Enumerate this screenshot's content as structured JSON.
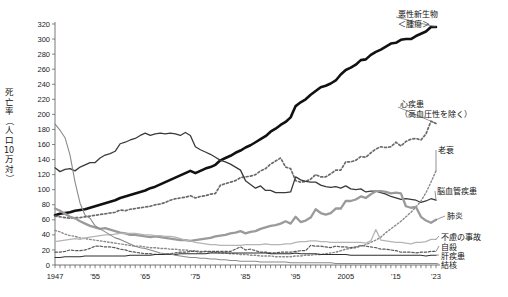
{
  "chart_data": {
    "type": "line",
    "title": "",
    "xlabel": "",
    "ylabel": "死亡率（人口10万対）",
    "ylabel_chars": [
      "死",
      "亡",
      "率",
      "（",
      "人",
      "口",
      "10",
      "万",
      "対",
      "）"
    ],
    "xlim": [
      1947,
      2023
    ],
    "ylim": [
      0,
      320
    ],
    "yticks": [
      0,
      20,
      40,
      60,
      80,
      100,
      120,
      140,
      160,
      180,
      200,
      220,
      240,
      260,
      280,
      300,
      320
    ],
    "xticks": [
      1947,
      1955,
      1965,
      1975,
      1985,
      1995,
      2005,
      2015,
      2023
    ],
    "xtick_labels": [
      "1947",
      "'55",
      "'65",
      "'75",
      "'85",
      "'95",
      "2005",
      "'15",
      "'23"
    ],
    "grid": false,
    "legend_position": "inline-right-labels",
    "x": [
      1947,
      1948,
      1949,
      1950,
      1951,
      1952,
      1953,
      1954,
      1955,
      1956,
      1957,
      1958,
      1959,
      1960,
      1961,
      1962,
      1963,
      1964,
      1965,
      1966,
      1967,
      1968,
      1969,
      1970,
      1971,
      1972,
      1973,
      1974,
      1975,
      1976,
      1977,
      1978,
      1979,
      1980,
      1981,
      1982,
      1983,
      1984,
      1985,
      1986,
      1987,
      1988,
      1989,
      1990,
      1991,
      1992,
      1993,
      1994,
      1995,
      1996,
      1997,
      1998,
      1999,
      2000,
      2001,
      2002,
      2003,
      2004,
      2005,
      2006,
      2007,
      2008,
      2009,
      2010,
      2011,
      2012,
      2013,
      2014,
      2015,
      2016,
      2017,
      2018,
      2019,
      2020,
      2021,
      2022,
      2023
    ],
    "series": [
      {
        "name": "悪性新生物＜腫瘍＞",
        "label_lines": [
          "悪性新生物",
          "＜腫瘍＞"
        ],
        "color": "#111111",
        "width": 2.6,
        "dash": "none",
        "values": [
          66,
          68,
          69,
          70,
          72,
          73,
          74,
          76,
          78,
          80,
          82,
          84,
          86,
          89,
          91,
          93,
          95,
          97,
          99,
          102,
          104,
          107,
          110,
          113,
          116,
          119,
          122,
          125,
          122,
          125,
          128,
          130,
          133,
          139,
          142,
          145,
          149,
          152,
          156,
          159,
          163,
          167,
          171,
          177,
          181,
          186,
          190,
          196,
          211,
          216,
          220,
          226,
          231,
          236,
          238,
          241,
          245,
          253,
          259,
          262,
          266,
          272,
          273,
          279,
          283,
          286,
          290,
          294,
          295,
          299,
          300,
          300,
          304,
          307,
          310,
          316,
          316
        ]
      },
      {
        "name": "心疾患（高血圧性を除く）",
        "label_lines": [
          "心疾患",
          "（高血圧性を除く）"
        ],
        "color": "#6a6a6a",
        "width": 1.7,
        "dash": "2,2.2",
        "values": [
          65,
          64,
          63,
          62,
          63,
          63,
          64,
          65,
          66,
          67,
          68,
          69,
          70,
          73,
          72,
          74,
          75,
          76,
          77,
          78,
          80,
          81,
          83,
          86,
          88,
          89,
          90,
          92,
          89,
          91,
          92,
          94,
          95,
          106,
          108,
          110,
          112,
          116,
          117,
          118,
          120,
          125,
          128,
          134,
          138,
          142,
          130,
          128,
          112,
          110,
          111,
          114,
          120,
          117,
          117,
          121,
          126,
          126,
          137,
          137,
          139,
          144,
          143,
          149,
          154,
          157,
          156,
          157,
          163,
          158,
          164,
          167,
          168,
          166,
          174,
          191,
          188
        ]
      },
      {
        "name": "脳血管疾患",
        "label_lines": [
          "脳血管疾患"
        ],
        "color": "#3a3a3a",
        "width": 1.3,
        "dash": "none",
        "values": [
          129,
          124,
          127,
          128,
          125,
          130,
          133,
          136,
          136,
          142,
          146,
          148,
          151,
          161,
          163,
          166,
          168,
          172,
          175,
          172,
          174,
          175,
          174,
          175,
          174,
          172,
          176,
          172,
          157,
          153,
          150,
          147,
          143,
          139,
          137,
          134,
          130,
          126,
          112,
          107,
          102,
          105,
          99,
          99,
          96,
          96,
          96,
          97,
          117,
          113,
          111,
          110,
          110,
          106,
          104,
          103,
          104,
          102,
          105,
          101,
          100,
          101,
          97,
          98,
          98,
          96,
          94,
          91,
          89,
          87,
          88,
          87,
          86,
          83,
          85,
          88,
          86
        ]
      },
      {
        "name": "老衰",
        "label_lines": [
          "老衰"
        ],
        "color": "#8a8a8a",
        "width": 1.4,
        "dash": "1.6,2",
        "values": [
          46,
          44,
          41,
          39,
          38,
          36,
          35,
          34,
          33,
          32,
          31,
          30,
          29,
          28,
          27,
          26,
          25,
          25,
          24,
          23,
          23,
          22,
          22,
          21,
          21,
          20,
          20,
          19,
          19,
          18,
          18,
          17,
          17,
          16,
          16,
          15,
          15,
          14,
          14,
          13,
          13,
          12,
          12,
          12,
          11,
          11,
          11,
          11,
          12,
          12,
          13,
          13,
          14,
          14,
          15,
          16,
          17,
          19,
          21,
          22,
          23,
          25,
          27,
          30,
          33,
          37,
          43,
          48,
          53,
          58,
          64,
          70,
          77,
          85,
          96,
          110,
          125
        ]
      },
      {
        "name": "肺炎",
        "label_lines": [
          "肺炎"
        ],
        "color": "#9a9a9a",
        "width": 2.3,
        "dash": "none",
        "values": [
          75,
          72,
          68,
          64,
          62,
          58,
          55,
          52,
          50,
          48,
          49,
          47,
          45,
          43,
          42,
          40,
          40,
          39,
          38,
          37,
          38,
          37,
          36,
          35,
          34,
          33,
          33,
          32,
          33,
          34,
          35,
          36,
          38,
          39,
          40,
          42,
          43,
          45,
          42,
          44,
          45,
          48,
          50,
          52,
          53,
          55,
          58,
          55,
          64,
          57,
          59,
          63,
          74,
          69,
          67,
          69,
          75,
          75,
          85,
          85,
          87,
          91,
          89,
          94,
          98,
          98,
          97,
          95,
          96,
          95,
          78,
          76,
          77,
          64,
          59,
          56,
          60
        ]
      },
      {
        "name": "不慮の事故",
        "label_lines": [
          "不慮の事故"
        ],
        "color": "#b5b5b5",
        "width": 1.3,
        "dash": "none",
        "values": [
          31,
          32,
          33,
          34,
          35,
          34,
          36,
          37,
          38,
          39,
          40,
          40,
          41,
          42,
          42,
          42,
          42,
          41,
          40,
          40,
          39,
          39,
          38,
          38,
          37,
          35,
          33,
          32,
          30,
          29,
          28,
          27,
          27,
          26,
          26,
          26,
          26,
          26,
          27,
          27,
          27,
          27,
          28,
          27,
          27,
          27,
          28,
          28,
          30,
          31,
          31,
          32,
          32,
          31,
          31,
          30,
          30,
          30,
          30,
          30,
          30,
          30,
          29,
          32,
          47,
          33,
          32,
          31,
          30,
          30,
          29,
          28,
          30,
          30,
          31,
          34,
          34
        ]
      },
      {
        "name": "自殺",
        "label_lines": [
          "自殺"
        ],
        "color": "#5a5a5a",
        "width": 1.2,
        "dash": "2.4,1.8",
        "values": [
          17,
          17,
          18,
          20,
          19,
          19,
          20,
          22,
          25,
          25,
          24,
          24,
          23,
          21,
          20,
          18,
          17,
          16,
          15,
          15,
          14,
          14,
          15,
          15,
          16,
          17,
          17,
          18,
          18,
          17,
          18,
          18,
          18,
          18,
          18,
          18,
          21,
          24,
          20,
          21,
          19,
          17,
          17,
          16,
          16,
          17,
          17,
          17,
          18,
          19,
          19,
          26,
          25,
          25,
          24,
          23,
          25,
          24,
          24,
          23,
          24,
          26,
          25,
          24,
          23,
          21,
          21,
          20,
          19,
          17,
          17,
          17,
          16,
          17,
          17,
          18,
          18
        ]
      },
      {
        "name": "肝疾患",
        "label_lines": [
          "肝疾患"
        ],
        "color": "#2f2f2f",
        "width": 1.1,
        "dash": "none",
        "values": [
          10,
          10,
          11,
          11,
          11,
          11,
          12,
          12,
          12,
          12,
          12,
          12,
          12,
          12,
          12,
          13,
          13,
          13,
          13,
          13,
          14,
          14,
          14,
          14,
          14,
          15,
          15,
          15,
          15,
          15,
          15,
          16,
          16,
          16,
          16,
          16,
          16,
          16,
          16,
          16,
          16,
          16,
          16,
          15,
          15,
          15,
          15,
          15,
          16,
          15,
          15,
          15,
          15,
          14,
          14,
          14,
          14,
          14,
          14,
          13,
          13,
          13,
          13,
          13,
          13,
          13,
          13,
          13,
          13,
          13,
          13,
          13,
          13,
          13,
          12,
          13,
          13
        ]
      },
      {
        "name": "結核",
        "label_lines": [
          "結核"
        ],
        "color": "#8a8a8a",
        "width": 1.1,
        "dash": "none",
        "values": [
          187,
          179,
          169,
          146,
          110,
          82,
          66,
          62,
          52,
          48,
          44,
          40,
          36,
          34,
          31,
          28,
          25,
          23,
          22,
          20,
          18,
          16,
          15,
          15,
          13,
          12,
          11,
          10,
          10,
          9,
          9,
          8,
          8,
          7,
          7,
          6,
          6,
          5,
          5,
          5,
          5,
          4,
          4,
          4,
          4,
          4,
          4,
          3,
          3,
          3,
          3,
          3,
          3,
          3,
          3,
          3,
          2,
          2,
          2,
          2,
          2,
          2,
          2,
          2,
          2,
          2,
          2,
          2,
          2,
          2,
          2,
          2,
          2,
          2,
          2,
          2,
          2
        ]
      }
    ]
  },
  "annotations": {
    "malignant": {
      "lines": [
        "悪性新生物",
        "＜腫瘍＞"
      ]
    },
    "heart": {
      "lines": [
        "心疾患",
        "（高血圧性を除く）"
      ]
    },
    "senility": {
      "lines": [
        "老衰"
      ]
    },
    "cerebro": {
      "lines": [
        "脳血管疾患"
      ]
    },
    "pneumonia": {
      "lines": [
        "肺炎"
      ]
    },
    "accident": {
      "lines": [
        "不慮の事故"
      ]
    },
    "suicide": {
      "lines": [
        "自殺"
      ]
    },
    "liver": {
      "lines": [
        "肝疾患"
      ]
    },
    "tuberculosis": {
      "lines": [
        "結核"
      ]
    }
  }
}
